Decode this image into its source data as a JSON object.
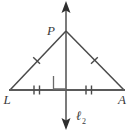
{
  "figure": {
    "background_color": "#ffffff",
    "stroke_color": "#5a5a5a",
    "label_color": "#3a3a3a",
    "labels": {
      "apex": "P",
      "left_base": "L",
      "right_base": "A",
      "line": "ℓ",
      "line_subscript": "2"
    },
    "marks": {
      "leg_tick_count": 1,
      "base_tick_count": 2,
      "right_angle": true,
      "arrow_heads": 2
    },
    "geometry": {
      "apex": [
        66,
        31
      ],
      "left_base": [
        10,
        90
      ],
      "right_base": [
        124,
        90
      ],
      "line_top": [
        66,
        3
      ],
      "line_bottom": [
        66,
        127
      ]
    }
  }
}
